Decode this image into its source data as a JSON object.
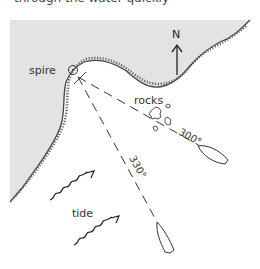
{
  "caption": {
    "text": "through the water quickly"
  },
  "map": {
    "land_color": "#e3e3e3",
    "coast_color": "#444444",
    "line_color": "#333333"
  },
  "labels": {
    "north": "N",
    "spire": "spire",
    "rocks": "rocks",
    "tide": "tide"
  },
  "bearings": [
    {
      "id": "bearing-300",
      "label": "300°"
    },
    {
      "id": "bearing-330",
      "label": "330°"
    }
  ],
  "icons": {
    "spire": "circle-dot-symbol",
    "north_arrow": "arrow-up",
    "tide_arrows": "wavy-arrow",
    "boats": "boat-outline",
    "rocks": "rock-outline"
  }
}
